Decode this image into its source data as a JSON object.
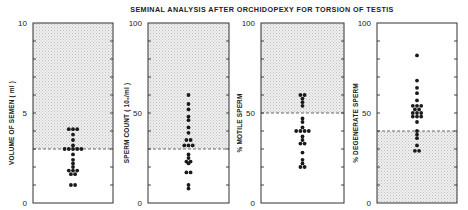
{
  "chart_data": [
    {
      "type": "scatter",
      "subtype": "dot-strip",
      "ylabel": "VOLUME OF SEMEN ( ml )",
      "ylim": [
        0,
        10
      ],
      "yticks": [
        0,
        5,
        10
      ],
      "minor_tick_step": 1,
      "reference_line": 3,
      "shaded_region": "above",
      "points": [
        {
          "y": 4.1,
          "n": 3
        },
        {
          "y": 3.8,
          "n": 1
        },
        {
          "y": 3.5,
          "n": 1
        },
        {
          "y": 3.2,
          "n": 1
        },
        {
          "y": 3.0,
          "n": 5
        },
        {
          "y": 2.7,
          "n": 1
        },
        {
          "y": 2.4,
          "n": 1
        },
        {
          "y": 2.2,
          "n": 1
        },
        {
          "y": 2.0,
          "n": 1
        },
        {
          "y": 1.8,
          "n": 3
        },
        {
          "y": 1.6,
          "n": 2
        },
        {
          "y": 1.0,
          "n": 2
        }
      ]
    },
    {
      "type": "scatter",
      "subtype": "dot-strip",
      "ylabel": "SPERM COUNT ( 10₆/ml )",
      "ylim": [
        0,
        100
      ],
      "yticks": [
        0,
        50,
        100
      ],
      "minor_tick_step": 10,
      "reference_line": 30,
      "shaded_region": "above",
      "points": [
        {
          "y": 60,
          "n": 1
        },
        {
          "y": 55,
          "n": 1
        },
        {
          "y": 52,
          "n": 1
        },
        {
          "y": 48,
          "n": 1
        },
        {
          "y": 46,
          "n": 1
        },
        {
          "y": 42,
          "n": 1
        },
        {
          "y": 39,
          "n": 1
        },
        {
          "y": 35,
          "n": 2
        },
        {
          "y": 32,
          "n": 3
        },
        {
          "y": 27,
          "n": 1
        },
        {
          "y": 25,
          "n": 1
        },
        {
          "y": 23,
          "n": 2
        },
        {
          "y": 22,
          "n": 1
        },
        {
          "y": 17,
          "n": 2
        },
        {
          "y": 10,
          "n": 1
        },
        {
          "y": 8,
          "n": 1
        }
      ]
    },
    {
      "type": "scatter",
      "subtype": "dot-strip",
      "ylabel": "% MOTILE SPERM",
      "ylim": [
        0,
        100
      ],
      "yticks": [
        0,
        50,
        100
      ],
      "minor_tick_step": 10,
      "reference_line": 50,
      "shaded_region": "above",
      "points": [
        {
          "y": 60,
          "n": 2
        },
        {
          "y": 58,
          "n": 1
        },
        {
          "y": 56,
          "n": 1
        },
        {
          "y": 54,
          "n": 1
        },
        {
          "y": 47,
          "n": 1
        },
        {
          "y": 45,
          "n": 1
        },
        {
          "y": 42,
          "n": 1
        },
        {
          "y": 40,
          "n": 4
        },
        {
          "y": 37,
          "n": 1
        },
        {
          "y": 35,
          "n": 1
        },
        {
          "y": 33,
          "n": 2
        },
        {
          "y": 28,
          "n": 1
        },
        {
          "y": 24,
          "n": 1
        },
        {
          "y": 22,
          "n": 1
        },
        {
          "y": 20,
          "n": 2
        }
      ]
    },
    {
      "type": "scatter",
      "subtype": "dot-strip",
      "ylabel": "% DEGENERATE SPERM",
      "ylim": [
        0,
        100
      ],
      "yticks": [
        0,
        50,
        100
      ],
      "minor_tick_step": 10,
      "reference_line": 40,
      "shaded_region": "below",
      "points": [
        {
          "y": 82,
          "n": 1
        },
        {
          "y": 68,
          "n": 1
        },
        {
          "y": 64,
          "n": 1
        },
        {
          "y": 61,
          "n": 1
        },
        {
          "y": 57,
          "n": 1
        },
        {
          "y": 54,
          "n": 3
        },
        {
          "y": 52,
          "n": 2
        },
        {
          "y": 50,
          "n": 3
        },
        {
          "y": 48,
          "n": 3
        },
        {
          "y": 45,
          "n": 1
        },
        {
          "y": 40,
          "n": 1
        },
        {
          "y": 38,
          "n": 1
        },
        {
          "y": 36,
          "n": 1
        },
        {
          "y": 32,
          "n": 1
        },
        {
          "y": 29,
          "n": 2
        }
      ]
    }
  ],
  "figure": {
    "title": "SEMINAL ANALYSIS AFTER ORCHIDOPEXY FOR TORSION OF TESTIS"
  },
  "panels": [
    {
      "max_label": "10",
      "mid_label": "5",
      "zero_label": "0",
      "ylabel": "VOLUME OF SEMEN ( ml )"
    },
    {
      "max_label": "100",
      "mid_label": "50",
      "zero_label": "0",
      "ylabel": "SPERM COUNT ( 10₆/ml )"
    },
    {
      "max_label": "100",
      "mid_label": "50",
      "zero_label": "0",
      "ylabel": "% MOTILE SPERM"
    },
    {
      "max_label": "100",
      "mid_label": "50",
      "zero_label": "0",
      "ylabel": "% DEGENERATE SPERM"
    }
  ],
  "colors": {
    "ink": "#1a1a1a",
    "shade": "#e4e4e4",
    "frame": "#333333",
    "background": "#ffffff"
  }
}
